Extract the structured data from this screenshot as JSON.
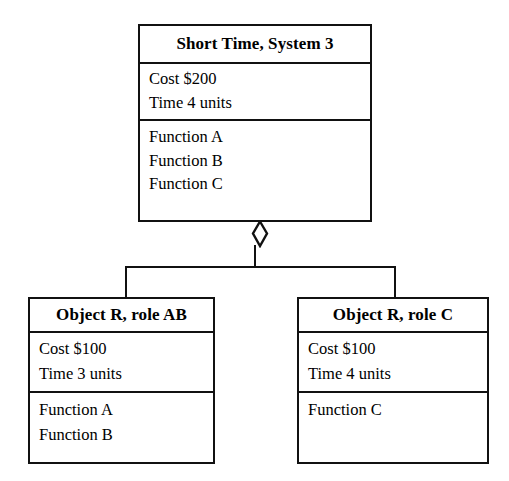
{
  "diagram": {
    "title_visible": false,
    "connector": {
      "type": "aggregation",
      "marker": "hollow-diamond",
      "parent": "Short Time, System 3",
      "children": [
        "Object R, role AB",
        "Object R, role C"
      ]
    },
    "colors": {
      "background": "#ffffff",
      "stroke": "#111111",
      "text": "#000000"
    }
  },
  "classes": [
    {
      "id": "system",
      "name": "Short Time, System 3",
      "attributes": [
        "Cost $200",
        "Time 4 units"
      ],
      "operations": [
        "Function A",
        "Function B",
        "Function C"
      ]
    },
    {
      "id": "role_ab",
      "name": "Object R, role AB",
      "attributes": [
        "Cost $100",
        "Time 3 units"
      ],
      "operations": [
        "Function A",
        "Function B"
      ]
    },
    {
      "id": "role_c",
      "name": "Object R, role C",
      "attributes": [
        "Cost $100",
        "Time 4 units"
      ],
      "operations": [
        "Function C"
      ]
    }
  ]
}
